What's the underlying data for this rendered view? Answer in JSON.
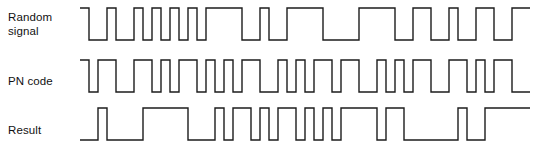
{
  "figure": {
    "stroke_color": "#1c1c1c",
    "background_color": "#ffffff",
    "rows": [
      {
        "key": "random",
        "label": "Random\nsignal"
      },
      {
        "key": "pn",
        "label": "PN code"
      },
      {
        "key": "result",
        "label": "Result"
      }
    ]
  },
  "chart_data": {
    "type": "line",
    "xlabel": "",
    "ylabel": "",
    "grid": false,
    "legend": "none",
    "timing": {
      "chip_width_px": 9.0,
      "origin_x_px": 4,
      "chip_count": 50,
      "high_y_px": 8,
      "low_y_px": 40
    },
    "series": [
      {
        "name": "Random signal",
        "label": "Random\nsignal",
        "row": "random",
        "levels": [
          "high",
          "low",
          "low",
          "high",
          "low",
          "low",
          "high",
          "low",
          "high",
          "low",
          "high",
          "low",
          "high",
          "low",
          "high",
          "high",
          "high",
          "high",
          "low",
          "low",
          "high",
          "low",
          "low",
          "high",
          "high",
          "high",
          "high",
          "low",
          "low",
          "low",
          "low",
          "high",
          "high",
          "high",
          "high",
          "low",
          "low",
          "high",
          "high",
          "low",
          "low",
          "high",
          "low",
          "low",
          "high",
          "high",
          "low",
          "low",
          "high",
          "high"
        ]
      },
      {
        "name": "PN code",
        "label": "PN code",
        "row": "pn",
        "levels": [
          "high",
          "low",
          "high",
          "high",
          "low",
          "low",
          "high",
          "high",
          "low",
          "high",
          "low",
          "high",
          "high",
          "low",
          "high",
          "low",
          "high",
          "low",
          "high",
          "high",
          "low",
          "low",
          "high",
          "low",
          "high",
          "low",
          "high",
          "high",
          "low",
          "high",
          "high",
          "low",
          "low",
          "high",
          "low",
          "high",
          "low",
          "high",
          "high",
          "low",
          "low",
          "high",
          "high",
          "low",
          "high",
          "low",
          "high",
          "high",
          "low",
          "low"
        ]
      },
      {
        "name": "Result",
        "label": "Result",
        "row": "result",
        "levels": [
          "low",
          "low",
          "high",
          "low",
          "low",
          "low",
          "low",
          "high",
          "high",
          "high",
          "high",
          "high",
          "low",
          "low",
          "low",
          "high",
          "low",
          "high",
          "high",
          "low",
          "high",
          "low",
          "high",
          "high",
          "low",
          "high",
          "low",
          "high",
          "low",
          "high",
          "high",
          "high",
          "high",
          "low",
          "high",
          "high",
          "low",
          "low",
          "low",
          "low",
          "low",
          "low",
          "high",
          "low",
          "low",
          "high",
          "high",
          "high",
          "high",
          "high"
        ]
      }
    ]
  }
}
